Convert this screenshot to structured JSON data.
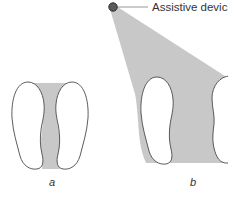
{
  "diagram": {
    "device_label": "Assistive device",
    "panels": [
      {
        "id": "a",
        "label": "a",
        "description": "Base of support: two feet, shaded area between feet"
      },
      {
        "id": "b",
        "label": "b",
        "description": "Base of support widened by assistive device: shaded area between feet and device"
      }
    ],
    "colors": {
      "shade": "#c8c8c8",
      "outline": "#4a4a4a",
      "device_fill": "#5a5a5a",
      "device_stroke": "#2e2e2e",
      "leader_line": "#8a8a8a",
      "text": "#333333"
    }
  }
}
